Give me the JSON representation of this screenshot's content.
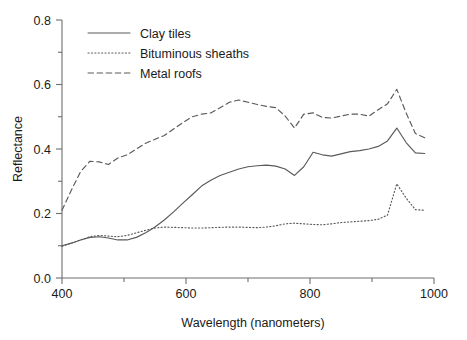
{
  "chart_data": {
    "type": "line",
    "title": "",
    "xlabel": "Wavelength (nanometers)",
    "ylabel": "Reflectance",
    "xlim": [
      400,
      1000
    ],
    "ylim": [
      0.0,
      0.8
    ],
    "xticks": [
      400,
      600,
      800,
      1000
    ],
    "xtick_labels": [
      "400",
      "600",
      "800",
      "1000"
    ],
    "xminor_ticks": [
      500,
      700,
      900
    ],
    "yticks": [
      0.0,
      0.2,
      0.4,
      0.6,
      0.8
    ],
    "ytick_labels": [
      "0.0",
      "0.2",
      "0.4",
      "0.6",
      "0.8"
    ],
    "yminor_ticks": [
      0.1,
      0.3,
      0.5,
      0.7
    ],
    "grid": false,
    "legend_position": "top-left",
    "line_color": "#5a5a5a",
    "axis_color": "#6e6e6e",
    "series": [
      {
        "name": "Clay tiles",
        "style": "solid",
        "x": [
          400,
          415,
          430,
          445,
          460,
          475,
          490,
          505,
          520,
          535,
          550,
          565,
          580,
          595,
          610,
          625,
          640,
          655,
          670,
          685,
          700,
          715,
          730,
          745,
          760,
          775,
          790,
          805,
          820,
          835,
          850,
          865,
          880,
          895,
          910,
          925,
          940,
          955,
          970,
          985
        ],
        "y": [
          0.1,
          0.108,
          0.118,
          0.126,
          0.128,
          0.124,
          0.118,
          0.118,
          0.126,
          0.14,
          0.158,
          0.18,
          0.205,
          0.232,
          0.258,
          0.285,
          0.303,
          0.318,
          0.328,
          0.338,
          0.345,
          0.348,
          0.35,
          0.347,
          0.338,
          0.318,
          0.345,
          0.39,
          0.382,
          0.378,
          0.385,
          0.392,
          0.395,
          0.4,
          0.408,
          0.425,
          0.465,
          0.42,
          0.388,
          0.386
        ]
      },
      {
        "name": "Bituminous sheaths",
        "style": "dotted",
        "x": [
          400,
          415,
          430,
          445,
          460,
          475,
          490,
          505,
          520,
          535,
          550,
          565,
          580,
          595,
          610,
          625,
          640,
          655,
          670,
          685,
          700,
          715,
          730,
          745,
          760,
          775,
          790,
          805,
          820,
          835,
          850,
          865,
          880,
          895,
          910,
          925,
          940,
          955,
          970,
          985
        ],
        "y": [
          0.098,
          0.108,
          0.118,
          0.128,
          0.132,
          0.13,
          0.128,
          0.132,
          0.14,
          0.148,
          0.155,
          0.158,
          0.157,
          0.156,
          0.155,
          0.155,
          0.156,
          0.157,
          0.158,
          0.158,
          0.157,
          0.156,
          0.158,
          0.162,
          0.168,
          0.17,
          0.168,
          0.166,
          0.165,
          0.168,
          0.172,
          0.174,
          0.176,
          0.178,
          0.182,
          0.195,
          0.292,
          0.248,
          0.212,
          0.21
        ]
      },
      {
        "name": "Metal roofs",
        "style": "dashed",
        "x": [
          400,
          415,
          430,
          445,
          460,
          475,
          490,
          505,
          520,
          535,
          550,
          565,
          580,
          595,
          610,
          625,
          640,
          655,
          670,
          685,
          700,
          715,
          730,
          745,
          760,
          775,
          790,
          805,
          820,
          835,
          850,
          865,
          880,
          895,
          910,
          925,
          940,
          955,
          970,
          985
        ],
        "y": [
          0.21,
          0.272,
          0.33,
          0.362,
          0.36,
          0.352,
          0.372,
          0.382,
          0.4,
          0.418,
          0.43,
          0.442,
          0.462,
          0.482,
          0.5,
          0.508,
          0.512,
          0.528,
          0.545,
          0.552,
          0.545,
          0.538,
          0.532,
          0.528,
          0.502,
          0.465,
          0.508,
          0.512,
          0.498,
          0.496,
          0.502,
          0.508,
          0.508,
          0.502,
          0.522,
          0.54,
          0.585,
          0.512,
          0.448,
          0.435
        ]
      }
    ]
  },
  "legend": {
    "items": [
      {
        "label": "Clay tiles",
        "style": "solid"
      },
      {
        "label": "Bituminous sheaths",
        "style": "dotted"
      },
      {
        "label": "Metal roofs",
        "style": "dashed"
      }
    ]
  }
}
